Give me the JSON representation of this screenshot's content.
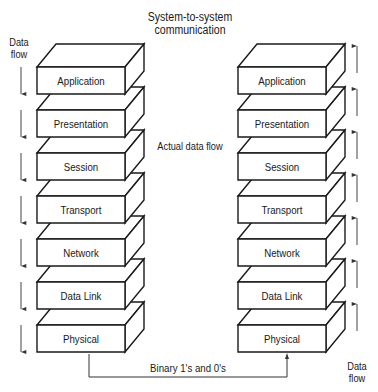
{
  "title": [
    "System-to-system",
    "communication"
  ],
  "left_flow_label": [
    "Data",
    "flow"
  ],
  "right_flow_label": [
    "Data",
    "flow"
  ],
  "middle_label": "Actual data flow",
  "connector_label": "Binary 1's and 0's",
  "left_stack": {
    "direction": "down",
    "layers": [
      "Application",
      "Presentation",
      "Session",
      "Transport",
      "Network",
      "Data Link",
      "Physical"
    ]
  },
  "right_stack": {
    "direction": "up",
    "layers": [
      "Application",
      "Presentation",
      "Session",
      "Transport",
      "Network",
      "Data Link",
      "Physical"
    ]
  },
  "colors": {
    "stroke": "#1a1a1a",
    "fill": "#ffffff",
    "arrow": "#555555"
  }
}
